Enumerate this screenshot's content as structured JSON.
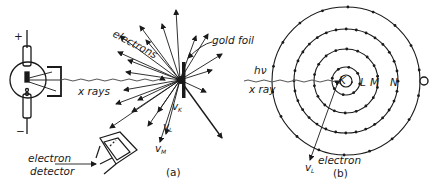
{
  "figure": {
    "panel_a": {
      "label": "(a)",
      "plus_sign": "+",
      "minus_sign": "−",
      "xray_label": "x rays",
      "electrons_label": "electrons",
      "foil_label": "gold foil",
      "detector_label_line1": "electron",
      "detector_label_line2": "detector",
      "velocity_labels": [
        "v",
        "v",
        "v"
      ],
      "velocity_subscripts": [
        "K",
        "L",
        "M"
      ]
    },
    "panel_b": {
      "label": "(b)",
      "photon_label": "hν",
      "xray_label": "x ray",
      "electron_label": "electron",
      "velocity_label": "v",
      "velocity_subscript": "L",
      "shell_labels": [
        "K",
        "L",
        "M",
        "N",
        "O"
      ]
    }
  }
}
